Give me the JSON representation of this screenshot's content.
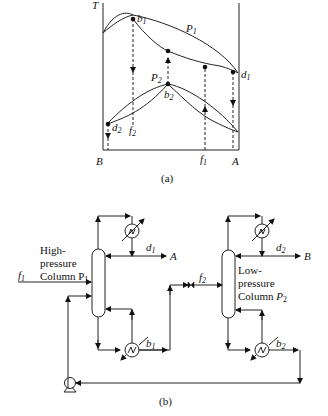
{
  "panel_a": {
    "axis_label_y": "T",
    "x_left_label": "B",
    "x_right_label": "A",
    "caption": "(a)",
    "curves": [
      {
        "name": "P",
        "sub": "1"
      },
      {
        "name": "P",
        "sub": "2"
      }
    ],
    "points": {
      "b1": {
        "name": "b",
        "sub": "1"
      },
      "d1": {
        "name": "d",
        "sub": "1"
      },
      "b2": {
        "name": "b",
        "sub": "2"
      },
      "d2": {
        "name": "d",
        "sub": "2"
      },
      "f1": {
        "name": "f",
        "sub": "1"
      },
      "f2": {
        "name": "f",
        "sub": "2"
      }
    }
  },
  "panel_b": {
    "caption": "(b)",
    "column1": {
      "line1": "High-",
      "line2": "pressure",
      "line3": "Column P",
      "sub": "1"
    },
    "column2": {
      "line1": "Low-",
      "line2": "pressure",
      "line3": "Column ",
      "italic": "P",
      "sub": "2"
    },
    "streams": {
      "f1": {
        "name": "f",
        "sub": "1"
      },
      "f2": {
        "name": "f",
        "sub": "2"
      },
      "d1": {
        "name": "d",
        "sub": "1"
      },
      "d2": {
        "name": "d",
        "sub": "2"
      },
      "b1": {
        "name": "b",
        "sub": "1"
      },
      "b2": {
        "name": "b",
        "sub": "2"
      },
      "A": "A",
      "B": "B"
    }
  }
}
